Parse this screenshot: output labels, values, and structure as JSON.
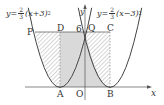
{
  "figure": {
    "equations": {
      "left": {
        "prefix": "y=",
        "num": "2",
        "den": "3",
        "body": "(x+3)",
        "exp": "2"
      },
      "right": {
        "prefix": "y=",
        "num": "2",
        "den": "3",
        "body": "(x−3)",
        "exp": "2"
      }
    },
    "axes": {
      "x_label": "x",
      "y_label": "y",
      "origin": "O"
    },
    "points": {
      "P": "P",
      "D": "D",
      "Q": "Q",
      "C": "C",
      "A": "A",
      "B": "B"
    },
    "tick_label_6": "6",
    "colors": {
      "curve": "#444444",
      "axis": "#555555",
      "shade": "#d9d9d9",
      "hatch": "#8a8a8a",
      "text": "#333333"
    }
  }
}
